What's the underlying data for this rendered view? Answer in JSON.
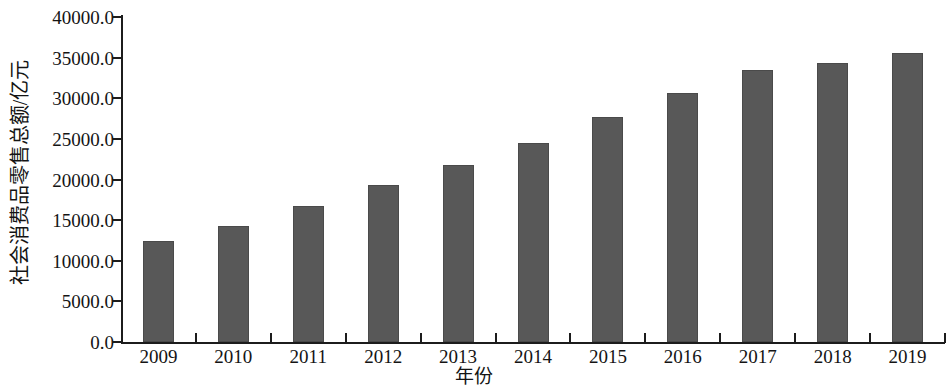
{
  "chart_data": {
    "type": "bar",
    "title": "",
    "subtitle": "",
    "xlabel": "年份",
    "ylabel": "社会消费品零售总额/亿元",
    "categories": [
      "2009",
      "2010",
      "2011",
      "2012",
      "2013",
      "2014",
      "2015",
      "2016",
      "2017",
      "2018",
      "2019"
    ],
    "values": [
      12400,
      14300,
      16700,
      19300,
      21800,
      24500,
      27700,
      30600,
      33500,
      34400,
      35600
    ],
    "ylim": [
      0,
      40000
    ],
    "ytick_labels": [
      "0.0",
      "5000.0",
      "10000.0",
      "15000.0",
      "20000.0",
      "25000.0",
      "30000.0",
      "35000.0",
      "40000.0"
    ],
    "ytick_values": [
      0,
      5000,
      10000,
      15000,
      20000,
      25000,
      30000,
      35000,
      40000
    ],
    "grid": false,
    "legend": null,
    "legend_position": "none",
    "series": [
      {
        "name": "社会消费品零售总额",
        "values": [
          12400,
          14300,
          16700,
          19300,
          21800,
          24500,
          27700,
          30600,
          33500,
          34400,
          35600
        ]
      }
    ],
    "colors": {
      "bar_fill": "#585858",
      "bar_border": "#4a4a4a",
      "axis": "#1c1c1c",
      "text": "#141414",
      "background": "#ffffff"
    }
  }
}
